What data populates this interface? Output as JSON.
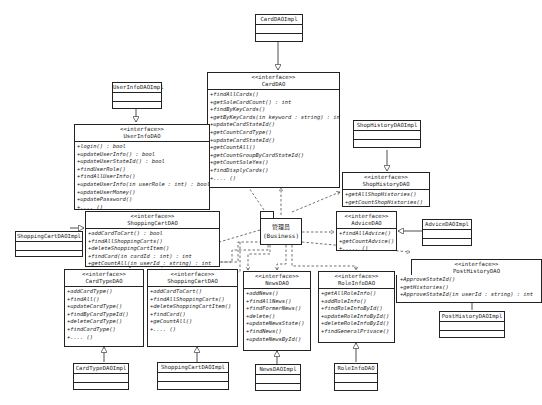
{
  "diagram": {
    "stereotype": "<<interface>>",
    "interfaces": {
      "card_dao": {
        "name": "CardDAO",
        "ops": [
          "+findAllCards()",
          "+getSaleCardCount() : int",
          "+findByKeyCards()",
          "+getByKeyCards(in keyword : string) : int",
          "+updateCardStateId()",
          "+getCountCardType()",
          "+updateCardStateId()",
          "+getCountAll()",
          "+getCountGroupByCardStateId()",
          "+getCountSaleYes()",
          "+findDisplyCards()",
          "+.... ()"
        ]
      },
      "user_info_dao": {
        "name": "UserInfoDAO",
        "ops": [
          "+login() : bool",
          "+updateUserInfo() : bool",
          "+updateUserStateId() : bool",
          "+findUserRole()",
          "+findAllUserInfo()",
          "+updateUserInfo(in userRole : int) : bool",
          "+updateUserMoney()",
          "+updatePassword()",
          "+.... ()"
        ]
      },
      "shopping_cart_dao_main": {
        "name": "ShoppingCartDAO",
        "ops": [
          "+addCardToCart() : bool",
          "+findAllShoppingCarts()",
          "+deleteShoppingCartItem()",
          "+findCard(in cardId : int) : int",
          "+getCountAll(in userId : string) : int",
          "+..... ()"
        ]
      },
      "shop_history_dao": {
        "name": "ShopHistoryDAO",
        "ops": [
          "+getAllShopHistories()",
          "+getCountShopHistories()"
        ]
      },
      "advice_dao": {
        "name": "AdviceDAO",
        "ops": [
          "+findAllAdvice()",
          "+getCountAdvice()",
          "+..... ()"
        ]
      },
      "post_history_dao": {
        "name": "PostHistoryDAO",
        "ops": [
          "+ApproveStateId()",
          "+getHistories()",
          "+ApproveStateId(in userId : string) : int"
        ]
      },
      "card_type_dao": {
        "name": "CardTypeDAO",
        "ops": [
          "+addCardType()",
          "+findAll()",
          "+updateCardType()",
          "+findByCardTypeId()",
          "+deleteCardType()",
          "+findCardType()",
          "+.... ()"
        ]
      },
      "shopping_cart_dao_2": {
        "name": "ShoppingCartDAO",
        "ops": [
          "+addCardToCart()",
          "+findAllShoppingCarts()",
          "+deleteShoppingCartItem()",
          "+findCard()",
          "+geCountAll()",
          "+.... ()"
        ]
      },
      "news_dao": {
        "name": "NewsDAO",
        "ops": [
          "+addNews()",
          "+findAllNews()",
          "+findFormerNews()",
          "+delete()",
          "+updateNewsState()",
          "+findNews()",
          "+updateNewsById()"
        ]
      },
      "role_info_dao": {
        "name": "RoleInfoDAO",
        "ops": [
          "+getAllRoleInfo()",
          "+addRoleInfo()",
          "+findRoleInfoById()",
          "+updateRoleInfoById()",
          "+deleteRoleInfoById()",
          "+findGeneralPrivace()"
        ]
      }
    },
    "impls": {
      "card_dao_impl": "CardDAOImpl",
      "user_info_dao_impl": "UserInfoDAOImpl",
      "shopping_cart_dao_impl_left": "ShoppingCartDAOImpl",
      "shop_history_dao_impl": "ShopHistoryDAOImpl",
      "advice_dao_impl": "AdviceDAOImpl",
      "post_history_dao_impl": "PostHistoryDAOImpl",
      "card_type_dao_impl": "CardTypeDAOImpl",
      "shopping_cart_dao_impl_bottom": "ShoppingCartDAOImpl",
      "news_dao_impl": "NewsDAOImpl",
      "role_info_dao_impl": "RoleInfoDAO"
    },
    "package": {
      "name": "管理员",
      "subtitle": "(Business)"
    }
  }
}
